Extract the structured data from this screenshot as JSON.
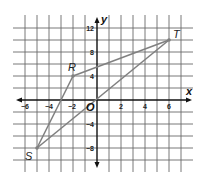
{
  "figure": {
    "type": "coordinate-plane",
    "axes": {
      "x_label": "x",
      "y_label": "y",
      "origin_label": "O"
    },
    "x_ticks": [
      {
        "value": -6,
        "label": "−6"
      },
      {
        "value": -4,
        "label": "−4"
      },
      {
        "value": -2,
        "label": "−2"
      },
      {
        "value": 2,
        "label": "2"
      },
      {
        "value": 4,
        "label": "4"
      },
      {
        "value": 6,
        "label": "6"
      }
    ],
    "y_ticks": [
      {
        "value": 12,
        "label": "12"
      },
      {
        "value": 8,
        "label": "8"
      },
      {
        "value": 4,
        "label": "4"
      },
      {
        "value": -4,
        "label": "−4"
      },
      {
        "value": -8,
        "label": "−8"
      }
    ],
    "grid": {
      "x_step": 1,
      "y_step": 2,
      "x_range": [
        -6,
        7
      ],
      "y_range": [
        -10,
        12
      ]
    },
    "points": [
      {
        "name": "R",
        "x": -2,
        "y": 4
      },
      {
        "name": "S",
        "x": -5,
        "y": -8
      },
      {
        "name": "T",
        "x": 6,
        "y": 10
      }
    ],
    "segments": [
      [
        "R",
        "T"
      ],
      [
        "R",
        "S"
      ],
      [
        "S",
        "T"
      ]
    ],
    "colors": {
      "grid": "#6a6a6a",
      "axis": "#111111",
      "shape": "#808080",
      "background": "#ffffff"
    }
  }
}
